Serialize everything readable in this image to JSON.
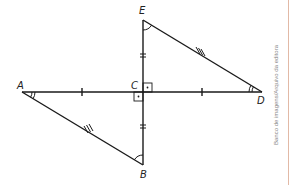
{
  "diagram": {
    "points": {
      "A": {
        "label": "A",
        "x": 22,
        "y": 92
      },
      "B": {
        "label": "B",
        "x": 143,
        "y": 165
      },
      "C": {
        "label": "C",
        "x": 143,
        "y": 92
      },
      "D": {
        "label": "D",
        "x": 262,
        "y": 92
      },
      "E": {
        "label": "E",
        "x": 143,
        "y": 20
      }
    },
    "segments": [
      "AD",
      "EB",
      "AB",
      "ED"
    ],
    "marks": {
      "AC_DC": "single tick",
      "EC_CB": "double tick",
      "AB_ED": "triple tick",
      "angle_A_D": "double arc",
      "angle_E_B": "single arc",
      "right_angles_at_C": 2
    },
    "credit": "Banco de imagens/Arquivo da editora",
    "colors": {
      "line": "#1a1a1a",
      "rule": "#e2b9a6",
      "credit": "#888888"
    }
  }
}
